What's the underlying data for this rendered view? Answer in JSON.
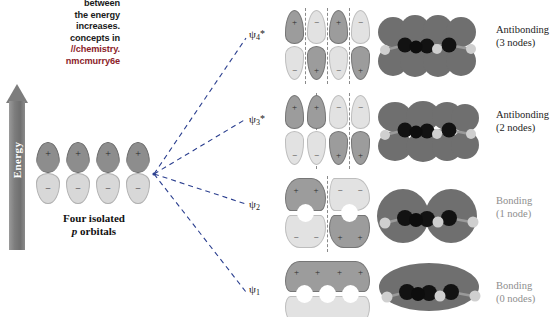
{
  "caption": {
    "lines": [
      "between",
      "the energy",
      "increases.",
      "concepts in",
      "//chemistry.",
      "nmcmurry6e"
    ],
    "url_line_index": 4,
    "url_line_index2": 5,
    "accent_color": "#8c1d2a"
  },
  "energy_axis": {
    "label": "Energy",
    "direction": "up",
    "color": "#7d7d7d",
    "text_color": "#ffffff"
  },
  "source_orbitals": {
    "caption_line1": "Four isolated",
    "caption_line2_italic": "p",
    "caption_line2_rest": " orbitals",
    "count": 4,
    "lobes": [
      {
        "top_sign": "+",
        "bottom_sign": "−"
      },
      {
        "top_sign": "+",
        "bottom_sign": "−"
      },
      {
        "top_sign": "+",
        "bottom_sign": "−"
      },
      {
        "top_sign": "+",
        "bottom_sign": "−"
      }
    ],
    "top_color": "#8d8d8d",
    "bottom_color": "#d8d8d8"
  },
  "molecular_orbitals": [
    {
      "id": "psi4",
      "symbol": "ψ",
      "subscript": "4",
      "star": "*",
      "label_line1": "Antibonding",
      "label_line2": "(3 nodes)",
      "nodes": 3,
      "bonding": "antibonding",
      "faded_label": false,
      "top_signs": [
        "+",
        "−",
        "+",
        "−"
      ],
      "bottom_signs": [
        "−",
        "+",
        "−",
        "+"
      ],
      "vertical_nodes": 3,
      "lobe_style": "separate"
    },
    {
      "id": "psi3",
      "symbol": "ψ",
      "subscript": "3",
      "star": "*",
      "label_line1": "Antibonding",
      "label_line2": "(2 nodes)",
      "nodes": 2,
      "bonding": "antibonding",
      "faded_label": false,
      "top_signs": [
        "+",
        "+",
        "−",
        "−"
      ],
      "bottom_signs": [
        "−",
        "−",
        "+",
        "+"
      ],
      "vertical_nodes": 2,
      "lobe_style": "separate"
    },
    {
      "id": "psi2",
      "symbol": "ψ",
      "subscript": "2",
      "star": "",
      "label_line1": "Bonding",
      "label_line2": "(1 node)",
      "nodes": 1,
      "bonding": "bonding",
      "faded_label": true,
      "top_signs": [
        "+",
        "+",
        "−",
        "−"
      ],
      "bottom_signs": [
        "−",
        "−",
        "+",
        "+"
      ],
      "vertical_nodes": 1,
      "lobe_style": "merged-pairs"
    },
    {
      "id": "psi1",
      "symbol": "ψ",
      "subscript": "1",
      "star": "",
      "label_line1": "Bonding",
      "label_line2": "(0 nodes)",
      "nodes": 0,
      "bonding": "bonding",
      "faded_label": true,
      "top_signs": [
        "+",
        "+",
        "+",
        "+"
      ],
      "bottom_signs": [
        "−",
        "−",
        "−",
        "−"
      ],
      "vertical_nodes": 0,
      "lobe_style": "merged-all"
    }
  ],
  "colors": {
    "positive_lobe": "#9c9c9c",
    "negative_lobe": "#e2e2e2",
    "surface_dark": "#6f6f6f",
    "surface_light": "#b9b9b9",
    "carbon_atom": "#111111",
    "hydrogen_atom": "#cfcfcf",
    "node_dash": "#8a8a8a",
    "background": "#ffffff"
  }
}
